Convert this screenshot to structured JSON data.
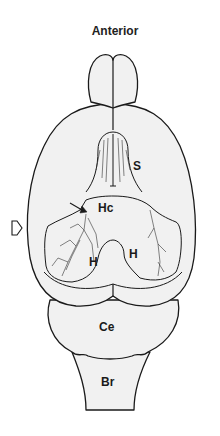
{
  "figure": {
    "title": "Anterior",
    "colors": {
      "fill": "#f1f1f1",
      "stroke": "#1a1a1a",
      "background": "#ffffff"
    },
    "labels": [
      {
        "id": "septum",
        "text": "S",
        "x": 133,
        "y": 160
      },
      {
        "id": "hippocampal-commissure",
        "text": "Hc",
        "x": 98,
        "y": 202
      },
      {
        "id": "hippocampus-left",
        "text": "H",
        "x": 89,
        "y": 256
      },
      {
        "id": "hippocampus-right",
        "text": "H",
        "x": 129,
        "y": 248
      },
      {
        "id": "cerebellum",
        "text": "Ce",
        "x": 99,
        "y": 321
      },
      {
        "id": "brainstem",
        "text": "Br",
        "x": 101,
        "y": 376
      }
    ],
    "indicator_arrow": {
      "direction": "right",
      "style": "outline"
    },
    "pointer_arrow": {
      "target": "left-hippocampal-branch"
    }
  }
}
